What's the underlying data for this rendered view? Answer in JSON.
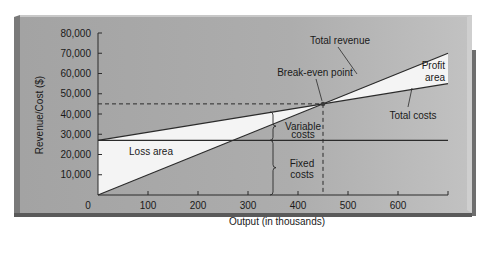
{
  "chart_data": {
    "type": "line",
    "title": "",
    "xlabel": "Output (in thousands)",
    "ylabel": "Revenue/Cost ($)",
    "xlim": [
      0,
      700
    ],
    "ylim": [
      0,
      80000
    ],
    "grid": false,
    "x_ticks": [
      0,
      100,
      200,
      300,
      400,
      500,
      600,
      700
    ],
    "x_tick_labels": [
      "0",
      "100",
      "200",
      "300",
      "400",
      "500",
      "600"
    ],
    "y_ticks": [
      10000,
      20000,
      30000,
      40000,
      50000,
      60000,
      70000,
      80000
    ],
    "y_tick_labels": [
      "10,000",
      "20,000",
      "30,000",
      "40,000",
      "50,000",
      "60,000",
      "70,000",
      "80,000"
    ],
    "series": [
      {
        "name": "Total revenue",
        "x": [
          0,
          700
        ],
        "y": [
          0,
          70000
        ]
      },
      {
        "name": "Total costs",
        "x": [
          0,
          700
        ],
        "y": [
          27000,
          55000
        ]
      },
      {
        "name": "Fixed costs",
        "x": [
          0,
          700
        ],
        "y": [
          27000,
          27000
        ]
      }
    ],
    "break_even": {
      "x": 450,
      "y": 45000
    },
    "regions": [
      {
        "name": "Loss area",
        "description": "between total costs and total revenue, x < 450"
      },
      {
        "name": "Profit area",
        "description": "between total revenue and total costs, x > 450"
      }
    ],
    "annotations": [
      {
        "text": "Total revenue"
      },
      {
        "text": "Break-even point"
      },
      {
        "text": "Profit area",
        "lines": [
          "Profit",
          "area"
        ]
      },
      {
        "text": "Total costs"
      },
      {
        "text": "Variable costs",
        "lines": [
          "Variable",
          "costs"
        ]
      },
      {
        "text": "Fixed costs",
        "lines": [
          "Fixed",
          "costs"
        ]
      },
      {
        "text": "Loss area"
      }
    ],
    "colors": {
      "panel": "#a9a9a9",
      "fill_region": "#f4f4f4",
      "line": "#2b2b2b"
    }
  }
}
